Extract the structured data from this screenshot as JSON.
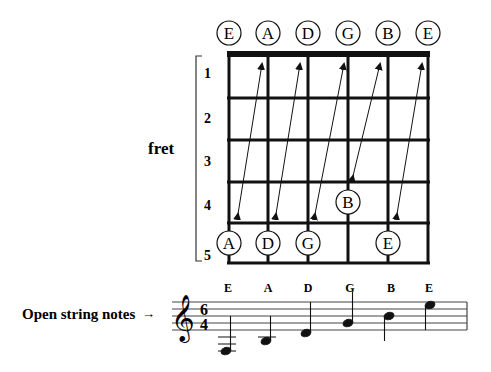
{
  "diagram": {
    "strings_header": [
      "E",
      "A",
      "D",
      "G",
      "B",
      "E"
    ],
    "fret_axis_label": "fret",
    "fret_numbers": [
      "1",
      "2",
      "3",
      "4",
      "5"
    ],
    "fretted_notes": [
      {
        "label": "A",
        "string": 1,
        "fret": 5
      },
      {
        "label": "D",
        "string": 2,
        "fret": 5
      },
      {
        "label": "G",
        "string": 3,
        "fret": 5
      },
      {
        "label": "B",
        "string": 4,
        "fret": 4
      },
      {
        "label": "E",
        "string": 5,
        "fret": 5
      }
    ],
    "arrows": [
      {
        "from": "A (string 1, fret 5)",
        "to": "open A (string 2)"
      },
      {
        "from": "D (string 2, fret 5)",
        "to": "open D (string 3)"
      },
      {
        "from": "G (string 3, fret 5)",
        "to": "open G (string 4)"
      },
      {
        "from": "open G (string 4)",
        "to": "B (string 4, fret 4)",
        "direction": "down"
      },
      {
        "from": "E (string 5, fret 5)",
        "to": "open E (string 6)"
      }
    ]
  },
  "staff": {
    "caption": "Open string notes",
    "caption_arrow": "→",
    "clef": "treble",
    "time_signature": {
      "top": "6",
      "bottom": "4"
    },
    "notes": [
      {
        "label": "E"
      },
      {
        "label": "A"
      },
      {
        "label": "D"
      },
      {
        "label": "G"
      },
      {
        "label": "B"
      },
      {
        "label": "E"
      }
    ]
  }
}
